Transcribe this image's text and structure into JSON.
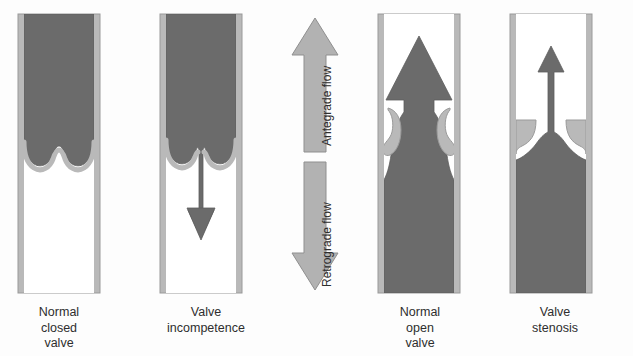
{
  "figure": {
    "background_color": "#fdfdfd"
  },
  "colors": {
    "blood": "#6b6b6b",
    "blood_edge": "#5d5d5d",
    "wall": "#b9b9b9",
    "wall_edge": "#9a9a9a",
    "lumen": "#ffffff",
    "arrow_fill": "#b2b2b2",
    "arrow_edge": "#8f8f8f",
    "text": "#2e2e2e"
  },
  "flow": {
    "antegrade_label": "Antegrade flow",
    "retrograde_label": "Retrograde flow",
    "antegrade_direction": "up",
    "retrograde_direction": "down"
  },
  "panels": [
    {
      "id": "normal-closed-valve",
      "caption": "Normal\nclosed\nvalve",
      "caption_lines": [
        "Normal",
        "closed",
        "valve"
      ],
      "valve_state": "closed",
      "cusps": "apposed",
      "blood_position": "above valve",
      "flow_arrow": "none"
    },
    {
      "id": "valve-incompetence",
      "caption": "Valve\nincompetence",
      "caption_lines": [
        "Valve",
        "incompetence"
      ],
      "valve_state": "incompetent",
      "cusps": "not apposed",
      "blood_position": "leaking downward through valve",
      "flow_arrow": "down"
    },
    {
      "id": "normal-open-valve",
      "caption": "Normal\nopen\nvalve",
      "caption_lines": [
        "Normal",
        "open",
        "valve"
      ],
      "valve_state": "open",
      "cusps": "retracted against wall",
      "blood_position": "filling vessel, flowing upward",
      "flow_arrow": "up"
    },
    {
      "id": "valve-stenosis",
      "caption": "Valve\nstenosis",
      "caption_lines": [
        "Valve",
        "stenosis"
      ],
      "valve_state": "stenotic",
      "cusps": "thickened, narrow orifice",
      "blood_position": "below valve, narrow jet upward",
      "flow_arrow": "up"
    }
  ]
}
